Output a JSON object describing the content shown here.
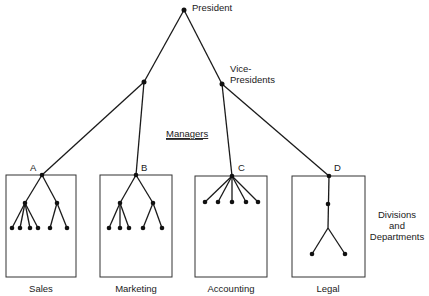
{
  "diagram": {
    "labels": {
      "president": "President",
      "vice_presidents_line1": "Vice-",
      "vice_presidents_line2": "Presidents",
      "managers": "Managers",
      "divisions_line1": "Divisions",
      "divisions_line2": "and",
      "divisions_line3": "Departments"
    },
    "divisions": [
      {
        "letter": "A",
        "name": "Sales",
        "structure": "two sub-managers with 4 and 2 subordinates"
      },
      {
        "letter": "B",
        "name": "Marketing",
        "structure": "two sub-managers with 3 and 2 subordinates"
      },
      {
        "letter": "C",
        "name": "Accounting",
        "structure": "5 direct subordinates"
      },
      {
        "letter": "D",
        "name": "Legal",
        "structure": "chain with 1 sub-manager then 2 subordinates"
      }
    ]
  }
}
